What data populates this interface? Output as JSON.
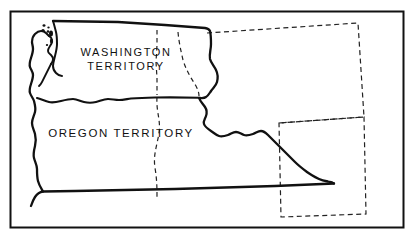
{
  "map": {
    "title": "Washington Territory and Oregon Territory",
    "background_color": "#ffffff",
    "ink_color": "#111111",
    "frame": {
      "name": "map-border-frame",
      "x": 10,
      "y": 11,
      "width": 394,
      "height": 217,
      "stroke_width": 2
    },
    "labels": [
      {
        "id": "washington-territory",
        "line1": "WASHINGTON",
        "line2": "TERRITORY",
        "x": 126,
        "y": 55
      },
      {
        "id": "oregon-territory",
        "line1": "OREGON  TERRITORY",
        "line2": "",
        "x": 121,
        "y": 136
      }
    ],
    "territories": [
      {
        "name": "Washington Territory",
        "label": "WASHINGTON TERRITORY",
        "boundary_style": "solid"
      },
      {
        "name": "Oregon Territory",
        "label": "OREGON TERRITORY",
        "boundary_style": "solid"
      }
    ],
    "dashed_boundaries": [
      {
        "name": "idaho-west-line-washington",
        "style": "dashed"
      },
      {
        "name": "idaho-west-line-oregon",
        "style": "dashed"
      },
      {
        "name": "idaho-east-line",
        "style": "dashed"
      },
      {
        "name": "montana-outline",
        "style": "dashed"
      },
      {
        "name": "wyoming-outline",
        "style": "dashed"
      }
    ],
    "features": [
      {
        "name": "puget-sound",
        "type": "coastal-inlet"
      },
      {
        "name": "san-juan-islands",
        "type": "islands",
        "count": 7
      },
      {
        "name": "pacific-coastline",
        "type": "coastline"
      },
      {
        "name": "snake-river-boundary",
        "type": "river-boundary"
      },
      {
        "name": "columbia-river-boundary",
        "type": "river-boundary"
      },
      {
        "name": "southeast-wyoming-point",
        "type": "territory-point"
      }
    ],
    "stroke_widths": {
      "territory_outline": 2.3,
      "internal_solid": 2.0,
      "dashed": 1.2,
      "island": 1.4
    }
  }
}
